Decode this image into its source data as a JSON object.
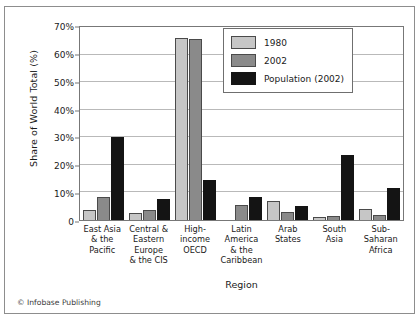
{
  "credit": "© Infobase Publishing",
  "legend": {
    "position": "top-right",
    "entries": [
      {
        "label": "1980",
        "color": "#c6c6c6",
        "key": "s1980"
      },
      {
        "label": "2002",
        "color": "#8a8a8a",
        "key": "s2002"
      },
      {
        "label": "Population (2002)",
        "color": "#141414",
        "key": "spop"
      }
    ]
  },
  "axes": {
    "ylabel": "Share of World Total (%)",
    "xlabel": "Region",
    "yticks": [
      "0",
      "10%",
      "20%",
      "30%",
      "40%",
      "50%",
      "60%",
      "70%"
    ]
  },
  "chart_data": {
    "type": "bar",
    "title": "",
    "xlabel": "Region",
    "ylabel": "Share of World Total (%)",
    "ylim": [
      0,
      70
    ],
    "ytick_values": [
      0,
      10,
      20,
      30,
      40,
      50,
      60,
      70
    ],
    "ytick_labels": [
      "0",
      "10%",
      "20%",
      "30%",
      "40%",
      "50%",
      "60%",
      "70%"
    ],
    "grid": true,
    "legend_position": "top-right",
    "categories": [
      "East Asia & the Pacific",
      "Central & Eastern Europe & the CIS",
      "High-income OECD",
      "Latin America & the Caribbean",
      "Arab States",
      "South Asia",
      "Sub-Saharan Africa"
    ],
    "category_lines": [
      [
        "East Asia",
        "& the",
        "Pacific"
      ],
      [
        "Central &",
        "Eastern",
        "Europe",
        "& the CIS"
      ],
      [
        "High-",
        "income",
        "OECD"
      ],
      [
        "Latin",
        "America",
        "& the",
        "Caribbean"
      ],
      [
        "Arab",
        "States"
      ],
      [
        "South",
        "Asia"
      ],
      [
        "Sub-",
        "Saharan",
        "Africa"
      ]
    ],
    "series": [
      {
        "name": "1980",
        "color": "#c6c6c6",
        "values": [
          3.5,
          2.5,
          66.0,
          0,
          7.0,
          1.0,
          4.0
        ]
      },
      {
        "name": "2002",
        "color": "#8a8a8a",
        "values": [
          8.5,
          3.5,
          65.5,
          5.5,
          3.0,
          1.5,
          2.0
        ]
      },
      {
        "name": "Population (2002)",
        "color": "#141414",
        "values": [
          30.0,
          7.5,
          14.5,
          8.5,
          5.0,
          23.5,
          11.5
        ]
      }
    ]
  }
}
